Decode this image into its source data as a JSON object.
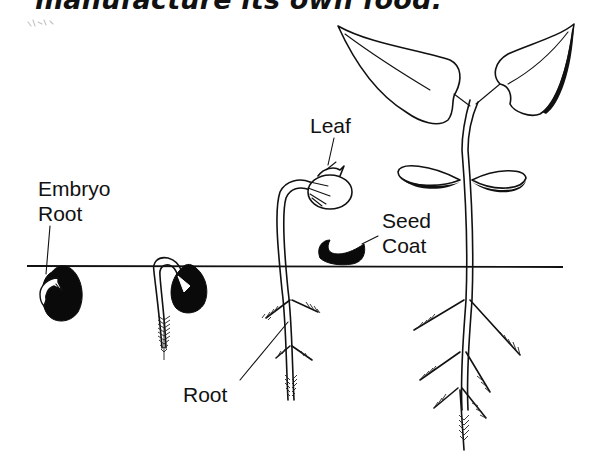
{
  "caption": "manufacture its own food.",
  "diagram": {
    "soil_line_color": "#111111",
    "stages": [
      {
        "id": 1,
        "description": "Seed with emerging embryo root"
      },
      {
        "id": 2,
        "description": "Seedling with hooked stem and root"
      },
      {
        "id": 3,
        "description": "Seedling emerging above soil with folded leaves"
      },
      {
        "id": 4,
        "description": "Young plant with open leaves and seed leaves"
      }
    ],
    "labels": {
      "embryo_root_line1": "Embryo",
      "embryo_root_line2": "Root",
      "leaf": "Leaf",
      "seed_coat_line1": "Seed",
      "seed_coat_line2": "Coat",
      "root": "Root"
    }
  }
}
